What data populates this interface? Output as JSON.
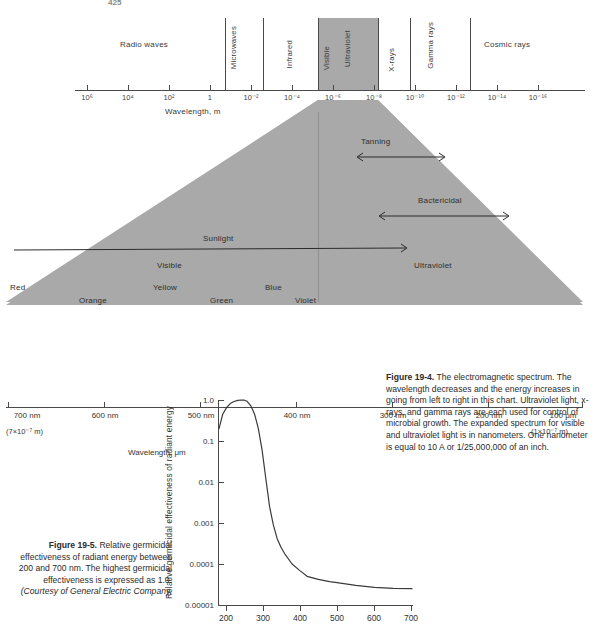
{
  "page": {
    "number": "425"
  },
  "em_spectrum": {
    "axis_title": "Wavelength, m",
    "tick_labels": [
      "10⁶",
      "10⁴",
      "10²",
      "1",
      "10⁻²",
      "10⁻⁴",
      "10⁻⁶",
      "10⁻⁸",
      "10⁻¹⁰",
      "10⁻¹²",
      "10⁻¹⁴",
      "10⁻¹⁶"
    ],
    "bands": [
      {
        "label": "Radio waves",
        "orientation": "horizontal"
      },
      {
        "label": "Microwaves",
        "orientation": "vertical"
      },
      {
        "label": "Infrared",
        "orientation": "vertical"
      },
      {
        "label": "Visible",
        "orientation": "vertical"
      },
      {
        "label": "Ultraviolet",
        "orientation": "vertical"
      },
      {
        "label": "X-rays",
        "orientation": "vertical"
      },
      {
        "label": "Gamma rays",
        "orientation": "vertical"
      },
      {
        "label": "Cosmic rays",
        "orientation": "horizontal"
      }
    ]
  },
  "expanded_spectrum": {
    "axis_title": "Wavelength, μm",
    "tick_labels": [
      "700 nm",
      "600 nm",
      "500 nm",
      "400 nm",
      "300 nm",
      "200 nm",
      "100 μm"
    ],
    "sub_label_left": "(7×10⁻⁷ m)",
    "sub_label_right": "(1×10⁻⁷ m)",
    "color_labels": [
      "Red",
      "Orange",
      "Yellow",
      "Green",
      "Blue",
      "Violet"
    ],
    "region_labels": [
      "Visible",
      "Ultraviolet"
    ],
    "arrows": [
      {
        "label": "Tanning"
      },
      {
        "label": "Bactericidal"
      },
      {
        "label": "Sunlight"
      }
    ]
  },
  "captions": {
    "fig_19_4_number": "Figure 19-4.",
    "fig_19_4_text": " The electromagnetic spectrum. The wavelength decreases and the energy increases in going from left to right in this chart. Ultraviolet light, x-rays, and gamma rays are each used for control of microbial growth. The expanded spectrum for visible and ultraviolet light is in nanometers. One nanometer is equal to 10 A or 1/25,000,000 of an inch.",
    "fig_19_5_number": "Figure 19-5.",
    "fig_19_5_text": " Relative germicidal effectiveness of radiant energy between 200 and 700 nm. The highest germicidal effectiveness is expressed as 1.0. ",
    "fig_19_5_italic": "(Courtesy of General Electric Company,"
  },
  "chart_data": {
    "type": "line",
    "title": "",
    "xlabel": "",
    "ylabel": "Relative germicidal effectiveness of radiant energy",
    "x_tick_labels": [
      "200",
      "300",
      "400",
      "500",
      "600",
      "700"
    ],
    "x_tick_values": [
      200,
      300,
      400,
      500,
      600,
      700
    ],
    "xlim": [
      185,
      700
    ],
    "y_tick_labels": [
      "1.0",
      "0.1",
      "0.01",
      "0.001",
      "0.0001",
      "0.00001"
    ],
    "y_tick_values": [
      1.0,
      0.1,
      0.01,
      0.001,
      0.0001,
      1e-05
    ],
    "ylim": [
      1e-05,
      1.0
    ],
    "y_scale": "log",
    "grid": false,
    "legend": "none",
    "series": [
      {
        "name": "Relative germicidal effectiveness",
        "x": [
          185,
          195,
          205,
          215,
          225,
          235,
          245,
          253,
          260,
          270,
          280,
          290,
          300,
          310,
          320,
          330,
          340,
          350,
          360,
          380,
          400,
          420,
          450,
          480,
          500,
          550,
          600,
          650,
          700
        ],
        "y": [
          0.2,
          0.45,
          0.65,
          0.82,
          0.92,
          0.98,
          1.0,
          0.99,
          0.93,
          0.72,
          0.45,
          0.2,
          0.06,
          0.012,
          0.0025,
          0.0009,
          0.00042,
          0.00026,
          0.00018,
          0.0001,
          7e-05,
          5e-05,
          4.2e-05,
          3.7e-05,
          3.5e-05,
          3e-05,
          2.7e-05,
          2.55e-05,
          2.5e-05
        ]
      }
    ]
  }
}
